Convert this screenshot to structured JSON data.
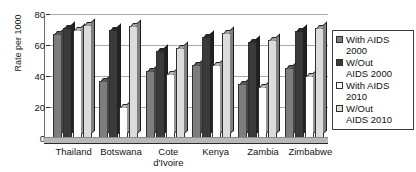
{
  "chart_data": {
    "type": "bar",
    "title": "",
    "xlabel": "",
    "ylabel": "Rate per 1000",
    "ylim": [
      0,
      80
    ],
    "yticks": [
      0,
      20,
      40,
      60,
      80
    ],
    "grid": true,
    "legend_position": "right",
    "categories": [
      "Thailand",
      "Botswana",
      "Cote d'Ivoire",
      "Kenya",
      "Zambia",
      "Zimbabwe"
    ],
    "series": [
      {
        "name": "With AIDS 2000",
        "values": [
          67,
          37,
          43,
          47,
          35,
          45
        ],
        "color": "#7d7d7d"
      },
      {
        "name": "W/Out AIDS 2000",
        "values": [
          71,
          70,
          56,
          65,
          62,
          69
        ],
        "color": "#3a3a3a"
      },
      {
        "name": "With AIDS 2010",
        "values": [
          70,
          20,
          41,
          47,
          33,
          40
        ],
        "color": "#ffffff"
      },
      {
        "name": "W/Out AIDS 2010",
        "values": [
          73,
          72,
          58,
          68,
          63,
          71
        ],
        "color": "#dcdcdc"
      }
    ]
  },
  "axis": {
    "y_title": "Rate per 1000",
    "tick_labels": [
      "80",
      "60",
      "40",
      "20",
      "0"
    ]
  },
  "legend": {
    "items": [
      {
        "label": "With AIDS\n2000",
        "swatch": "#7d7d7d"
      },
      {
        "label": "W/Out\nAIDS 2000",
        "swatch": "#3a3a3a"
      },
      {
        "label": "With AIDS\n2010",
        "swatch": "#ffffff"
      },
      {
        "label": "W/Out\nAIDS 2010",
        "swatch": "#dcdcdc"
      }
    ]
  }
}
